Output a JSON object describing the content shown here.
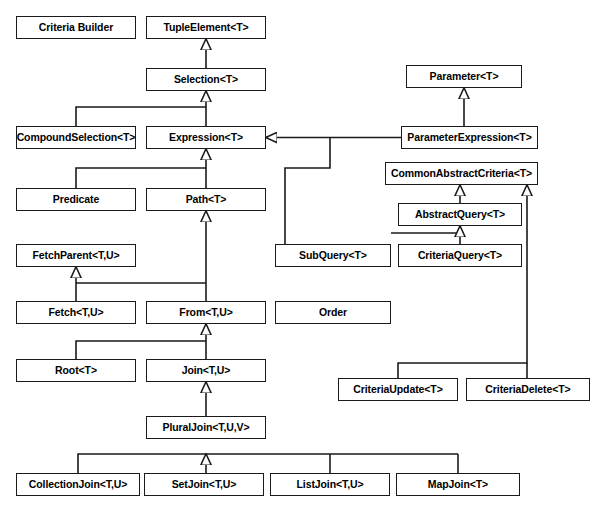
{
  "diagram": {
    "type": "uml-class-diagram",
    "width": 603,
    "height": 514,
    "background_color": "#ffffff",
    "box_fill_color": "#ffffff",
    "box_border_color": "#1a1a1a",
    "line_color": "#1a1a1a",
    "text_color": "#000000",
    "arrow_style": "hollow-triangle-generalization",
    "nodes": [
      {
        "id": "criteria_builder",
        "label": "Criteria Builder",
        "x": 16,
        "y": 16,
        "w": 120,
        "h": 23
      },
      {
        "id": "tuple_element",
        "label": "TupleElement<T>",
        "x": 146,
        "y": 16,
        "w": 120,
        "h": 23
      },
      {
        "id": "selection",
        "label": "Selection<T>",
        "x": 146,
        "y": 68,
        "w": 120,
        "h": 23
      },
      {
        "id": "parameter",
        "label": "Parameter<T>",
        "x": 406,
        "y": 65,
        "w": 116,
        "h": 23
      },
      {
        "id": "compound_selection",
        "label": "CompoundSelection<T>",
        "x": 16,
        "y": 126,
        "w": 120,
        "h": 23
      },
      {
        "id": "expression",
        "label": "Expression<T>",
        "x": 146,
        "y": 126,
        "w": 120,
        "h": 23
      },
      {
        "id": "parameter_expression",
        "label": "ParameterExpression<T>",
        "x": 401,
        "y": 126,
        "w": 137,
        "h": 23
      },
      {
        "id": "common_abstract_criteria",
        "label": "CommonAbstractCriteria<T>",
        "x": 385,
        "y": 162,
        "w": 153,
        "h": 23
      },
      {
        "id": "predicate",
        "label": "Predicate",
        "x": 16,
        "y": 188,
        "w": 120,
        "h": 23
      },
      {
        "id": "path",
        "label": "Path<T>",
        "x": 146,
        "y": 188,
        "w": 120,
        "h": 23
      },
      {
        "id": "abstract_query",
        "label": "AbstractQuery<T>",
        "x": 398,
        "y": 203,
        "w": 124,
        "h": 23
      },
      {
        "id": "fetch_parent",
        "label": "FetchParent<T,U>",
        "x": 16,
        "y": 244,
        "w": 120,
        "h": 23
      },
      {
        "id": "sub_query",
        "label": "SubQuery<T>",
        "x": 275,
        "y": 244,
        "w": 116,
        "h": 23
      },
      {
        "id": "criteria_query",
        "label": "CriteriaQuery<T>",
        "x": 398,
        "y": 244,
        "w": 124,
        "h": 23
      },
      {
        "id": "fetch",
        "label": "Fetch<T,U>",
        "x": 16,
        "y": 301,
        "w": 120,
        "h": 23
      },
      {
        "id": "from",
        "label": "From<T,U>",
        "x": 146,
        "y": 301,
        "w": 120,
        "h": 23
      },
      {
        "id": "order",
        "label": "Order",
        "x": 275,
        "y": 301,
        "w": 116,
        "h": 23
      },
      {
        "id": "root",
        "label": "Root<T>",
        "x": 16,
        "y": 359,
        "w": 120,
        "h": 23
      },
      {
        "id": "join",
        "label": "Join<T,U>",
        "x": 146,
        "y": 359,
        "w": 120,
        "h": 23
      },
      {
        "id": "criteria_update",
        "label": "CriteriaUpdate<T>",
        "x": 338,
        "y": 378,
        "w": 120,
        "h": 23
      },
      {
        "id": "criteria_delete",
        "label": "CriteriaDelete<T>",
        "x": 466,
        "y": 378,
        "w": 124,
        "h": 23
      },
      {
        "id": "plural_join",
        "label": "PluralJoin<T,U,V>",
        "x": 146,
        "y": 416,
        "w": 120,
        "h": 23
      },
      {
        "id": "collection_join",
        "label": "CollectionJoin<T,U>",
        "x": 16,
        "y": 473,
        "w": 124,
        "h": 23
      },
      {
        "id": "set_join",
        "label": "SetJoin<T,U>",
        "x": 144,
        "y": 473,
        "w": 120,
        "h": 23
      },
      {
        "id": "list_join",
        "label": "ListJoin<T,U>",
        "x": 270,
        "y": 473,
        "w": 120,
        "h": 23
      },
      {
        "id": "map_join",
        "label": "MapJoin<T>",
        "x": 396,
        "y": 473,
        "w": 124,
        "h": 23
      }
    ],
    "edges": [
      {
        "from": "selection",
        "to": "tuple_element",
        "kind": "generalization"
      },
      {
        "from": "compound_selection",
        "to": "selection",
        "kind": "generalization"
      },
      {
        "from": "expression",
        "to": "selection",
        "kind": "generalization"
      },
      {
        "from": "predicate",
        "to": "expression",
        "kind": "generalization"
      },
      {
        "from": "path",
        "to": "expression",
        "kind": "generalization"
      },
      {
        "from": "parameter_expression",
        "to": "parameter",
        "kind": "generalization"
      },
      {
        "from": "parameter_expression",
        "to": "expression",
        "kind": "generalization"
      },
      {
        "from": "sub_query",
        "to": "expression",
        "kind": "generalization"
      },
      {
        "from": "sub_query",
        "to": "abstract_query",
        "kind": "generalization"
      },
      {
        "from": "abstract_query",
        "to": "common_abstract_criteria",
        "kind": "generalization"
      },
      {
        "from": "criteria_query",
        "to": "abstract_query",
        "kind": "generalization"
      },
      {
        "from": "criteria_update",
        "to": "common_abstract_criteria",
        "kind": "generalization"
      },
      {
        "from": "criteria_delete",
        "to": "common_abstract_criteria",
        "kind": "generalization"
      },
      {
        "from": "from",
        "to": "path",
        "kind": "generalization"
      },
      {
        "from": "from",
        "to": "fetch_parent",
        "kind": "generalization"
      },
      {
        "from": "fetch",
        "to": "fetch_parent",
        "kind": "generalization"
      },
      {
        "from": "root",
        "to": "from",
        "kind": "generalization"
      },
      {
        "from": "join",
        "to": "from",
        "kind": "generalization"
      },
      {
        "from": "plural_join",
        "to": "join",
        "kind": "generalization"
      },
      {
        "from": "collection_join",
        "to": "plural_join",
        "kind": "generalization"
      },
      {
        "from": "set_join",
        "to": "plural_join",
        "kind": "generalization"
      },
      {
        "from": "list_join",
        "to": "plural_join",
        "kind": "generalization"
      },
      {
        "from": "map_join",
        "to": "plural_join",
        "kind": "generalization"
      }
    ]
  }
}
